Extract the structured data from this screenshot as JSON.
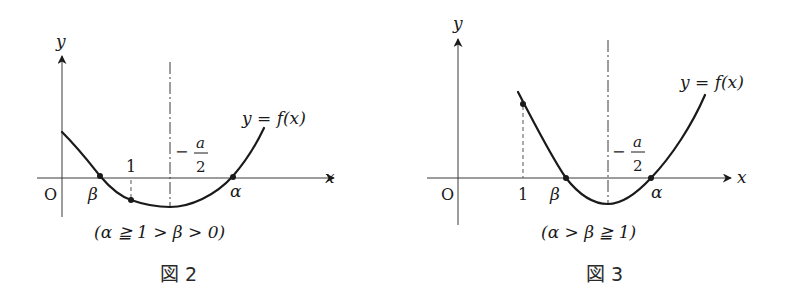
{
  "figures": [
    {
      "id": "fig2",
      "caption": "図 2",
      "axis_labels": {
        "x": "x",
        "y": "y",
        "origin": "O"
      },
      "curve_label": "y = f(x)",
      "symmetry_label_minus": "−",
      "symmetry_label_num": "a",
      "symmetry_label_den": "2",
      "tick_one": "1",
      "root_beta": "β",
      "root_alpha": "α",
      "condition": "(α ≧ 1 > β > 0)"
    },
    {
      "id": "fig3",
      "caption": "図 3",
      "axis_labels": {
        "x": "x",
        "y": "y",
        "origin": "O"
      },
      "curve_label": "y = f(x)",
      "symmetry_label_minus": "−",
      "symmetry_label_num": "a",
      "symmetry_label_den": "2",
      "tick_one": "1",
      "root_beta": "β",
      "root_alpha": "α",
      "condition": "(α > β ≧ 1)"
    }
  ],
  "colors": {
    "ink": "#1a1a1a",
    "axis": "#3a3a3a",
    "background": "#ffffff"
  }
}
